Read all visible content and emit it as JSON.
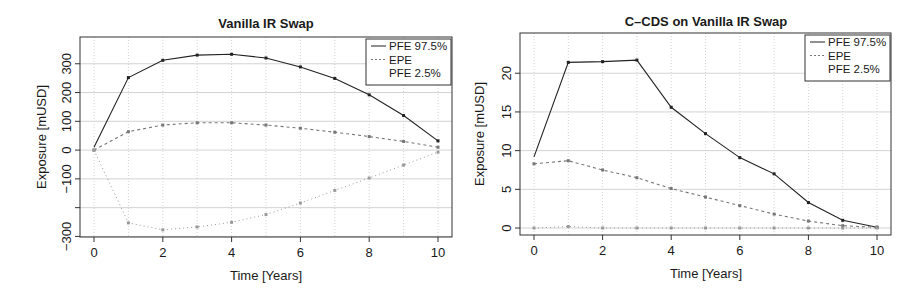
{
  "chart_data": [
    {
      "type": "line",
      "title": "Vanilla IR Swap",
      "xlabel": "Time [Years]",
      "ylabel": "Exposure [mUSD]",
      "x": [
        0,
        1,
        2,
        3,
        4,
        5,
        6,
        7,
        8,
        9,
        10
      ],
      "xticks": [
        0,
        2,
        4,
        6,
        8,
        10
      ],
      "yticks": [
        300,
        200,
        100,
        0,
        -100,
        -200,
        -300
      ],
      "ytick_labels": [
        "300",
        "200",
        "100",
        "0",
        "−100",
        "",
        "−300"
      ],
      "xlim": [
        -0.4,
        10.4
      ],
      "ylim": [
        -302,
        393
      ],
      "grid": true,
      "legend_position": "top-right",
      "series": [
        {
          "name": "PFE 97.5%",
          "style": "solid",
          "values": [
            10,
            252,
            312,
            330,
            333,
            320,
            289,
            249,
            192,
            120,
            32
          ]
        },
        {
          "name": "EPE",
          "style": "dashed",
          "values": [
            0,
            64,
            87,
            95,
            95,
            87,
            76,
            62,
            47,
            30,
            10
          ]
        },
        {
          "name": "PFE 2.5%",
          "style": "dotted",
          "values": [
            0,
            -253,
            -277,
            -267,
            -251,
            -224,
            -184,
            -140,
            -97,
            -52,
            -7
          ]
        }
      ]
    },
    {
      "type": "line",
      "title": "C–CDS on Vanilla IR Swap",
      "xlabel": "Time [Years]",
      "ylabel": "Exposure [mUSD]",
      "x": [
        0,
        1,
        2,
        3,
        4,
        5,
        6,
        7,
        8,
        9,
        10
      ],
      "xticks": [
        0,
        2,
        4,
        6,
        8,
        10
      ],
      "yticks": [
        0,
        5,
        10,
        15,
        20
      ],
      "ytick_labels": [
        "0",
        "5",
        "10",
        "15",
        "20"
      ],
      "xlim": [
        -0.4,
        10.4
      ],
      "ylim": [
        -0.9,
        25.2
      ],
      "grid": true,
      "legend_position": "top-right",
      "series": [
        {
          "name": "PFE 97.5%",
          "style": "solid",
          "values": [
            9.2,
            21.4,
            21.5,
            21.7,
            15.6,
            12.2,
            9.1,
            7.0,
            3.3,
            1.0,
            0.1
          ]
        },
        {
          "name": "EPE",
          "style": "dashed",
          "values": [
            8.3,
            8.7,
            7.5,
            6.5,
            5.1,
            4.0,
            2.9,
            1.8,
            0.9,
            0.3,
            0.1
          ]
        },
        {
          "name": "PFE 2.5%",
          "style": "dotted",
          "values": [
            0.0,
            0.2,
            0.0,
            0.0,
            0.0,
            0.0,
            0.0,
            0.0,
            0.0,
            0.0,
            0.0
          ]
        }
      ]
    }
  ],
  "colors": {
    "pfe_high": "#222222",
    "epe": "#777777",
    "pfe_low": "#9a9a9a",
    "grid": "#c8c8c8",
    "frame": "#333333"
  }
}
